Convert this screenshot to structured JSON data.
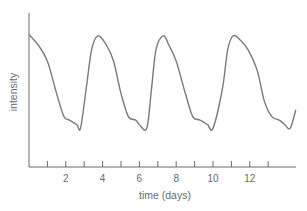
{
  "chart_data": {
    "type": "line",
    "title": "",
    "xlabel": "time (days)",
    "ylabel": "intensity",
    "xlim": [
      0,
      14.5
    ],
    "ylim": [
      0,
      1
    ],
    "grid": false,
    "legend": null,
    "x_ticks": [
      1,
      2,
      3,
      4,
      5,
      6,
      7,
      8,
      9,
      10,
      11,
      12,
      13
    ],
    "x_tick_labels": [
      {
        "value": 2,
        "label": "2"
      },
      {
        "value": 4,
        "label": "4"
      },
      {
        "value": 6,
        "label": "6"
      },
      {
        "value": 8,
        "label": "8"
      },
      {
        "value": 10,
        "label": "10"
      },
      {
        "value": 12,
        "label": "12"
      },
      {
        "value": 14,
        "label": ""
      }
    ],
    "y_ticks": [],
    "series": [
      {
        "name": "intensity",
        "color": "#7a7a7a",
        "x": [
          0,
          0.5,
          1.0,
          1.5,
          1.9,
          2.2,
          2.6,
          2.8,
          3.1,
          3.4,
          3.75,
          4.2,
          4.6,
          5.0,
          5.4,
          5.8,
          6.0,
          6.4,
          6.65,
          6.9,
          7.3,
          7.6,
          8.0,
          8.5,
          8.9,
          9.3,
          9.7,
          10.0,
          10.5,
          10.8,
          11.1,
          11.5,
          11.9,
          12.4,
          12.8,
          13.2,
          13.6,
          13.9,
          14.2,
          14.5
        ],
        "y": [
          0.93,
          0.84,
          0.7,
          0.42,
          0.22,
          0.19,
          0.15,
          0.12,
          0.45,
          0.8,
          0.92,
          0.84,
          0.7,
          0.42,
          0.22,
          0.19,
          0.15,
          0.12,
          0.45,
          0.8,
          0.92,
          0.84,
          0.7,
          0.42,
          0.22,
          0.19,
          0.15,
          0.12,
          0.45,
          0.8,
          0.92,
          0.88,
          0.8,
          0.62,
          0.35,
          0.22,
          0.19,
          0.15,
          0.12,
          0.28
        ]
      }
    ]
  },
  "plot": {
    "x_axis_label": "time (days)",
    "y_axis_label": "intensity"
  }
}
